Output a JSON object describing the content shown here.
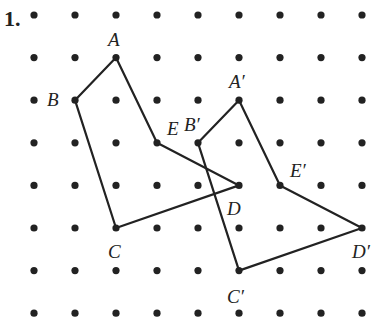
{
  "problem_number": "1.",
  "grid": {
    "cols": 9,
    "rows": 8,
    "x0": 34,
    "dx": 41,
    "y0": 15,
    "dy": 42.6,
    "dot_color": "#222222"
  },
  "figures": [
    {
      "name": "original",
      "vertices": [
        {
          "label": "A",
          "col": 2,
          "row": 1,
          "lx": -8,
          "ly": -12
        },
        {
          "label": "E",
          "col": 3,
          "row": 3,
          "lx": 10,
          "ly": -8
        },
        {
          "label": "D",
          "col": 5,
          "row": 4,
          "lx": -12,
          "ly": 30
        },
        {
          "label": "C",
          "col": 2,
          "row": 5,
          "lx": -8,
          "ly": 30
        },
        {
          "label": "B",
          "col": 1,
          "row": 2,
          "lx": -28,
          "ly": 6
        }
      ]
    },
    {
      "name": "image",
      "vertices": [
        {
          "label": "A′",
          "col": 5,
          "row": 2,
          "lx": -10,
          "ly": -12
        },
        {
          "label": "E′",
          "col": 6,
          "row": 4,
          "lx": 10,
          "ly": -8
        },
        {
          "label": "D′",
          "col": 8,
          "row": 5,
          "lx": -10,
          "ly": 30
        },
        {
          "label": "C′",
          "col": 5,
          "row": 6,
          "lx": -12,
          "ly": 32
        },
        {
          "label": "B′",
          "col": 4,
          "row": 3,
          "lx": -14,
          "ly": -12
        }
      ]
    }
  ],
  "stroke_color": "#222222"
}
